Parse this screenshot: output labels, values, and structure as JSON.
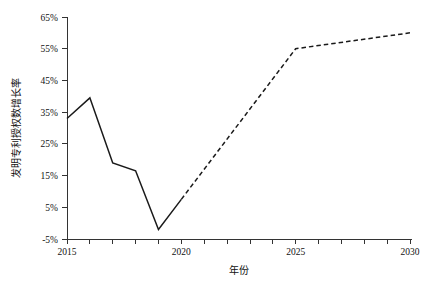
{
  "chart_data": {
    "type": "line",
    "title": "",
    "xlabel": "年份",
    "ylabel": "发明专利授权数增长率",
    "xlim": [
      2015,
      2030
    ],
    "ylim": [
      -5,
      65
    ],
    "grid": false,
    "legend": "none",
    "x_ticks": [
      2015,
      2020,
      2025,
      2030
    ],
    "x_tick_labels": [
      "2015",
      "2020",
      "2025",
      "2030"
    ],
    "x_minor_ticks": [
      2016,
      2017,
      2018,
      2019,
      2021,
      2022,
      2023,
      2024,
      2026,
      2027,
      2028,
      2029
    ],
    "y_ticks": [
      -5,
      5,
      15,
      25,
      35,
      45,
      55,
      65
    ],
    "y_tick_labels": [
      "-5%",
      "5%",
      "15%",
      "25%",
      "35%",
      "45%",
      "55%",
      "65%"
    ],
    "series": [
      {
        "name": "历史值",
        "style": "solid",
        "color": "#1a1a1a",
        "x": [
          2015,
          2016,
          2017,
          2018,
          2019,
          2020
        ],
        "values": [
          33,
          39.5,
          19,
          16.5,
          -2,
          7.5
        ]
      },
      {
        "name": "预测值",
        "style": "dashed",
        "color": "#1a1a1a",
        "x": [
          2020,
          2025,
          2030
        ],
        "values": [
          7.5,
          55,
          60
        ]
      }
    ]
  },
  "axes": {
    "x_title": "年份",
    "y_title": "发明专利授权数增长率"
  },
  "y_tick_text": {
    "t0": "-5%",
    "t1": "5%",
    "t2": "15%",
    "t3": "25%",
    "t4": "35%",
    "t5": "45%",
    "t6": "55%",
    "t7": "65%"
  },
  "x_tick_text": {
    "t0": "2015",
    "t1": "2020",
    "t2": "2025",
    "t3": "2030"
  }
}
